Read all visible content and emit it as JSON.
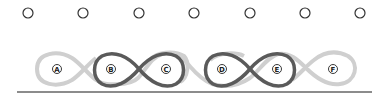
{
  "pegs": {
    "count": 7,
    "x": [
      28,
      83,
      139,
      194,
      250,
      305,
      360
    ],
    "y": 13,
    "radius": 5,
    "stroke": "#333333"
  },
  "loops": {
    "labels": [
      "A",
      "B",
      "C",
      "D",
      "E",
      "F"
    ],
    "label_x": [
      57,
      111,
      166,
      222,
      277,
      333
    ],
    "label_y": 69,
    "light_color": "#c8c8c8",
    "dark_color": "#555555",
    "highlighted_pairs": [
      [
        "B",
        "C"
      ],
      [
        "D",
        "E"
      ]
    ]
  },
  "baseline": {
    "x1": 17,
    "x2": 372,
    "y": 92,
    "color": "#666666"
  }
}
